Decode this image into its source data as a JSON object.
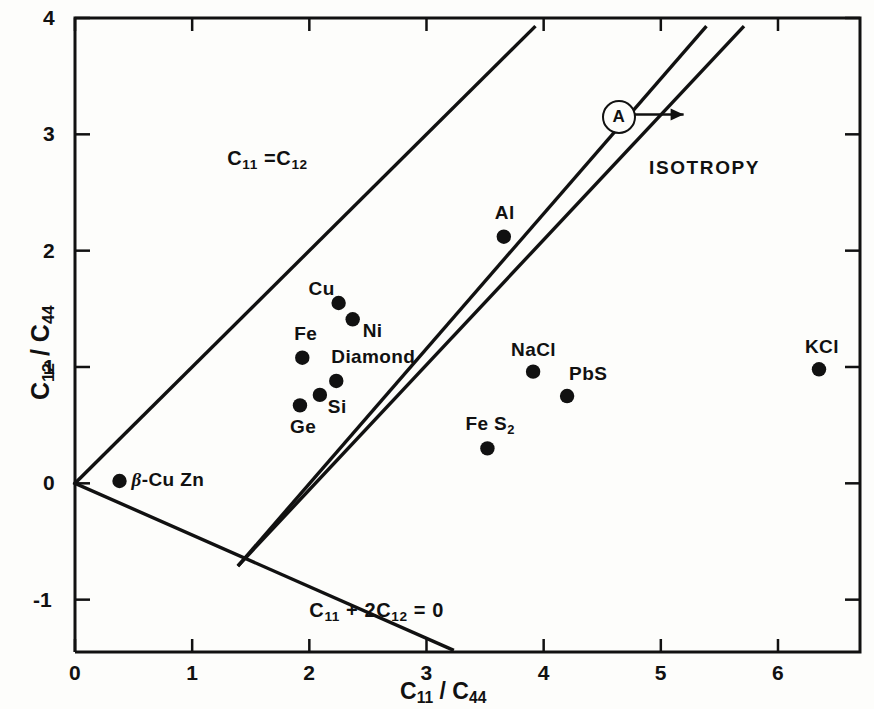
{
  "chart_data": {
    "type": "scatter",
    "title": "",
    "xlabel": "C11 / C44",
    "ylabel": "C12 / C44",
    "xlabel_parts": {
      "num1": "C",
      "sub1": "11",
      "slash": "/",
      "num2": "C",
      "sub2": "44"
    },
    "ylabel_parts": {
      "num1": "C",
      "sub1": "12",
      "slash": "/",
      "num2": "C",
      "sub2": "44"
    },
    "xlim": [
      0,
      6.7
    ],
    "ylim": [
      -1.45,
      4
    ],
    "xticks": [
      0,
      1,
      2,
      3,
      4,
      5,
      6
    ],
    "xticklabels": [
      "0",
      "1",
      "2",
      "3",
      "4",
      "5",
      "6"
    ],
    "yticks": [
      -1,
      0,
      1,
      2,
      3,
      4
    ],
    "yticklabels": [
      "-1",
      "0",
      "1",
      "2",
      "3",
      "4"
    ],
    "grid": false,
    "legend": "none",
    "points": [
      {
        "label": "β-Cu Zn",
        "x": 0.38,
        "y": 0.02,
        "label_dx": 12,
        "label_dy": -11,
        "italic_prefix": true
      },
      {
        "label": "Fe",
        "x": 1.94,
        "y": 1.08,
        "label_dx": -8,
        "label_dy": -34
      },
      {
        "label": "Ge",
        "x": 1.92,
        "y": 0.67,
        "label_dx": -10,
        "label_dy": 12
      },
      {
        "label": "Si",
        "x": 2.09,
        "y": 0.76,
        "label_dx": 8,
        "label_dy": 2
      },
      {
        "label": "Diamond",
        "x": 2.23,
        "y": 0.88,
        "label_dx": -5,
        "label_dy": -34
      },
      {
        "label": "Cu",
        "x": 2.25,
        "y": 1.55,
        "label_dx": -30,
        "label_dy": -24
      },
      {
        "label": "Ni",
        "x": 2.37,
        "y": 1.41,
        "label_dx": 10,
        "label_dy": 2
      },
      {
        "label": "Fe S2",
        "x": 3.52,
        "y": 0.3,
        "label_dx": -22,
        "label_dy": -34,
        "sub_tail": "2"
      },
      {
        "label": "Al",
        "x": 3.66,
        "y": 2.12,
        "label_dx": -9,
        "label_dy": -34
      },
      {
        "label": "NaCl",
        "x": 3.91,
        "y": 0.96,
        "label_dx": -22,
        "label_dy": -32
      },
      {
        "label": "PbS",
        "x": 4.2,
        "y": 0.75,
        "label_dx": 2,
        "label_dy": -32
      },
      {
        "label": "KCl",
        "x": 6.35,
        "y": 0.98,
        "label_dx": -14,
        "label_dy": -32
      }
    ],
    "lines": [
      {
        "name": "C11=C12",
        "x0": 0.0,
        "y0": 0.0,
        "x1": 3.92,
        "y1": 3.92
      },
      {
        "name": "isotropy-lower",
        "x0": 1.4,
        "y0": -0.7,
        "x1": 5.38,
        "y1": 3.92
      },
      {
        "name": "isotropy-upper",
        "x0": 1.4,
        "y0": -0.7,
        "x1": 5.7,
        "y1": 3.92
      },
      {
        "name": "C11+2C12=0",
        "x0": 0.0,
        "y0": 0.0,
        "x1": 3.22,
        "y1": -1.43
      }
    ],
    "annotations": [
      {
        "name": "c11-eq-c12",
        "text": "C11 =C12",
        "x": 1.35,
        "y": 2.85
      },
      {
        "name": "isotropy",
        "text": "ISOTROPY",
        "x": 5.05,
        "y": 2.78
      },
      {
        "name": "c11-plus-2c12",
        "text": "C11 + 2C12 = 0",
        "x": 2.05,
        "y": -1.02
      },
      {
        "name": "callout-a",
        "text": "A",
        "x": 4.58,
        "y": 3.17
      }
    ]
  },
  "labels": {
    "c11_eq_c12": {
      "c": "C",
      "s1": "11",
      "eq": "=",
      "c2": "C",
      "s2": "12"
    },
    "c11_plus_2c12": {
      "c": "C",
      "s1": "11",
      "plus": "+ 2",
      "c2": "C",
      "s2": "12",
      "eq": "= 0"
    },
    "isotropy": "ISOTROPY",
    "callout_a": "A"
  }
}
